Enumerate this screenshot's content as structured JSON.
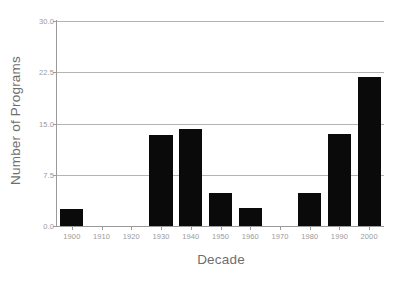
{
  "chart_data": {
    "type": "bar",
    "title": "",
    "xlabel": "Decade",
    "ylabel": "Number of Programs",
    "categories": [
      "1900",
      "1910",
      "1920",
      "1930",
      "1940",
      "1950",
      "1960",
      "1970",
      "1980",
      "1990",
      "2000"
    ],
    "values": [
      2.5,
      0,
      0,
      13.3,
      14.2,
      4.8,
      2.6,
      0,
      4.9,
      13.4,
      21.8
    ],
    "ylim": [
      0,
      30
    ],
    "yticks": [
      "0.0",
      "7.5",
      "15.0",
      "22.5",
      "30.0"
    ],
    "ytick_values": [
      0,
      7.5,
      15,
      22.5,
      30
    ],
    "grid": true,
    "legend": "none",
    "bar_color": "#0a0a0a",
    "grid_color": "#b4b4b4",
    "axis_color": "#9a9a9a",
    "text_color": "#6e6e6e",
    "background": "#ffffff"
  }
}
